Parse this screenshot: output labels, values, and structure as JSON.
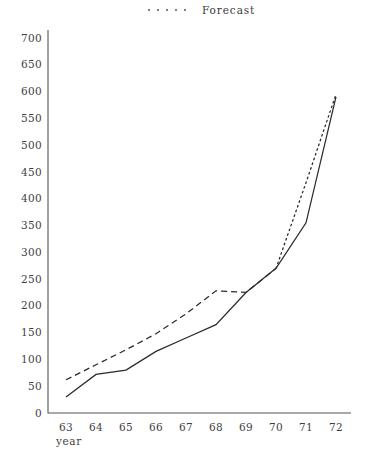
{
  "legend": {
    "forecast_label": "Forecast",
    "marker_icon": "dotted-line-icon",
    "dot_count": 5
  },
  "axes": {
    "x_title": "year",
    "y_title": "",
    "y_ticks": [
      "0",
      "50",
      "100",
      "150",
      "200",
      "250",
      "300",
      "350",
      "400",
      "450",
      "500",
      "550",
      "600",
      "650",
      "700"
    ],
    "x_ticks": [
      "63",
      "64",
      "65",
      "66",
      "67",
      "68",
      "69",
      "70",
      "71",
      "72"
    ]
  },
  "colors": {
    "line": "#2b2b2b",
    "axis": "#555555",
    "text": "#3f3f3f",
    "background": "#ffffff"
  },
  "chart_data": {
    "type": "line",
    "title": "",
    "xlabel": "year",
    "ylabel": "",
    "xlim": [
      63,
      72
    ],
    "ylim": [
      0,
      700
    ],
    "grid": false,
    "legend_position": "top-center",
    "x": [
      63,
      64,
      65,
      66,
      67,
      68,
      69,
      70,
      71,
      72
    ],
    "series": [
      {
        "name": "Actual",
        "style": "solid",
        "values": [
          30,
          72,
          80,
          115,
          140,
          165,
          225,
          270,
          355,
          590
        ]
      },
      {
        "name": "Forecast",
        "style": "dashed-then-dotted",
        "values": [
          62,
          90,
          118,
          148,
          185,
          228,
          225,
          270,
          430,
          595
        ],
        "dashed_range": [
          63,
          70
        ],
        "dotted_range": [
          70,
          72
        ]
      }
    ]
  }
}
